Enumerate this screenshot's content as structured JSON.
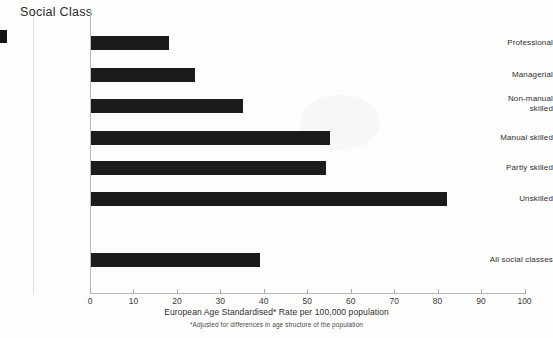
{
  "chart_data": {
    "type": "bar",
    "orientation": "horizontal",
    "title": "",
    "ylabel": "Social Class",
    "xlabel": "European Age Standardised* Rate per 100,000 population",
    "footnote": "*Adjusted for differences in age structure of the population",
    "categories": [
      "Professional",
      "Managerial",
      "Non-manual skilled",
      "Manual skilled",
      "Partly skilled",
      "Unskilled",
      "All social classes"
    ],
    "values": [
      18,
      24,
      35,
      55,
      54,
      82,
      39
    ],
    "xlim": [
      0,
      100
    ],
    "xticks": [
      0,
      10,
      20,
      30,
      40,
      50,
      60,
      70,
      80,
      90,
      100
    ],
    "xtick_labels": [
      "0",
      "10",
      "20",
      "30",
      "40",
      "50",
      "60",
      "70",
      "80",
      "90",
      "100"
    ],
    "grid": false,
    "legend": null,
    "bar_color": "#1b1b1b",
    "axis_color": "#b8b8b6",
    "background_color": "#fdfdfc"
  },
  "axis": {
    "y_title": "Social Class",
    "x_label": "European Age Standardised* Rate per 100,000 population",
    "x_footnote": "*Adjusted for differences in age structure of the population"
  },
  "categories": [
    {
      "label": "Professional",
      "line1": "Professional",
      "line2": "",
      "value": 18
    },
    {
      "label": "Managerial",
      "line1": "Managerial",
      "line2": "",
      "value": 24
    },
    {
      "label": "Non-manual skilled",
      "line1": "Non-manual",
      "line2": "skilled",
      "value": 35
    },
    {
      "label": "Manual skilled",
      "line1": "Manual skilled",
      "line2": "",
      "value": 55
    },
    {
      "label": "Partly skilled",
      "line1": "Partly skilled",
      "line2": "",
      "value": 54
    },
    {
      "label": "Unskilled",
      "line1": "Unskilled",
      "line2": "",
      "value": 82
    },
    {
      "label": "All social classes",
      "line1": "All social classes",
      "line2": "",
      "value": 39
    }
  ],
  "xticks": [
    {
      "label": "0",
      "value": 0
    },
    {
      "label": "10",
      "value": 10
    },
    {
      "label": "20",
      "value": 20
    },
    {
      "label": "30",
      "value": 30
    },
    {
      "label": "40",
      "value": 40
    },
    {
      "label": "50",
      "value": 50
    },
    {
      "label": "60",
      "value": 60
    },
    {
      "label": "70",
      "value": 70
    },
    {
      "label": "80",
      "value": 80
    },
    {
      "label": "90",
      "value": 90
    },
    {
      "label": "100",
      "value": 100
    }
  ]
}
